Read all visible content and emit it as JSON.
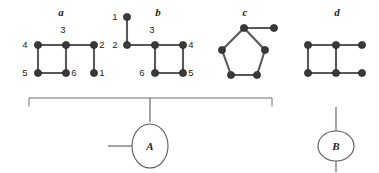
{
  "diagram": {
    "background_color": "#ffffff",
    "edge_color": "#58585b",
    "node_color": "#3a3a3c",
    "label_color": "#231f20",
    "bracket_color": "#6d6e71"
  },
  "graphs": [
    {
      "id": "graph-a",
      "label": "a",
      "label_pos": {
        "x": 61,
        "y": 16
      },
      "vertices": [
        {
          "name": "v4",
          "label": "4",
          "x": 38,
          "y": 45,
          "label_pos": {
            "x": 25,
            "y": 48
          }
        },
        {
          "name": "v3",
          "label": "3",
          "x": 66,
          "y": 45,
          "label_pos": {
            "x": 63,
            "y": 33
          }
        },
        {
          "name": "v2",
          "label": "2",
          "x": 94,
          "y": 45,
          "label_pos": {
            "x": 102,
            "y": 48
          }
        },
        {
          "name": "v5",
          "label": "5",
          "x": 38,
          "y": 73,
          "label_pos": {
            "x": 25,
            "y": 76
          }
        },
        {
          "name": "v6",
          "label": "6",
          "x": 66,
          "y": 73,
          "label_pos": {
            "x": 74,
            "y": 76
          }
        },
        {
          "name": "v1",
          "label": "1",
          "x": 94,
          "y": 73,
          "label_pos": {
            "x": 102,
            "y": 76
          }
        }
      ],
      "edges": [
        {
          "from": "v4",
          "to": "v3"
        },
        {
          "from": "v3",
          "to": "v2"
        },
        {
          "from": "v4",
          "to": "v5"
        },
        {
          "from": "v3",
          "to": "v6"
        },
        {
          "from": "v5",
          "to": "v6"
        },
        {
          "from": "v2",
          "to": "v1"
        }
      ]
    },
    {
      "id": "graph-b",
      "label": "b",
      "label_pos": {
        "x": 158,
        "y": 16
      },
      "vertices": [
        {
          "name": "v1",
          "label": "1",
          "x": 127,
          "y": 17,
          "label_pos": {
            "x": 115,
            "y": 20
          }
        },
        {
          "name": "v2",
          "label": "2",
          "x": 127,
          "y": 45,
          "label_pos": {
            "x": 115,
            "y": 48
          }
        },
        {
          "name": "v3",
          "label": "3",
          "x": 155,
          "y": 45,
          "label_pos": {
            "x": 152,
            "y": 33
          }
        },
        {
          "name": "v4",
          "label": "4",
          "x": 183,
          "y": 45,
          "label_pos": {
            "x": 191,
            "y": 48
          }
        },
        {
          "name": "v6",
          "label": "6",
          "x": 155,
          "y": 73,
          "label_pos": {
            "x": 142,
            "y": 76
          }
        },
        {
          "name": "v5",
          "label": "5",
          "x": 183,
          "y": 73,
          "label_pos": {
            "x": 191,
            "y": 76
          }
        }
      ],
      "edges": [
        {
          "from": "v1",
          "to": "v2"
        },
        {
          "from": "v2",
          "to": "v3"
        },
        {
          "from": "v3",
          "to": "v4"
        },
        {
          "from": "v3",
          "to": "v6"
        },
        {
          "from": "v4",
          "to": "v5"
        },
        {
          "from": "v6",
          "to": "v5"
        }
      ]
    },
    {
      "id": "graph-c",
      "label": "c",
      "label_pos": {
        "x": 245,
        "y": 16
      },
      "vertices": [
        {
          "name": "p1",
          "label": "",
          "x": 244,
          "y": 28,
          "label_pos": null
        },
        {
          "name": "p2",
          "label": "",
          "x": 274,
          "y": 28,
          "label_pos": null
        },
        {
          "name": "p3",
          "label": "",
          "x": 222,
          "y": 50,
          "label_pos": null
        },
        {
          "name": "p4",
          "label": "",
          "x": 265,
          "y": 50,
          "label_pos": null
        },
        {
          "name": "p5",
          "label": "",
          "x": 231,
          "y": 75,
          "label_pos": null
        },
        {
          "name": "p6",
          "label": "",
          "x": 257,
          "y": 75,
          "label_pos": null
        }
      ],
      "edges": [
        {
          "from": "p1",
          "to": "p2"
        },
        {
          "from": "p1",
          "to": "p3"
        },
        {
          "from": "p1",
          "to": "p4"
        },
        {
          "from": "p3",
          "to": "p5"
        },
        {
          "from": "p4",
          "to": "p6"
        },
        {
          "from": "p5",
          "to": "p6"
        }
      ]
    },
    {
      "id": "graph-d",
      "label": "d",
      "label_pos": {
        "x": 337,
        "y": 16
      },
      "vertices": [
        {
          "name": "q1",
          "label": "",
          "x": 308,
          "y": 45,
          "label_pos": null
        },
        {
          "name": "q2",
          "label": "",
          "x": 336,
          "y": 45,
          "label_pos": null
        },
        {
          "name": "q3",
          "label": "",
          "x": 362,
          "y": 45,
          "label_pos": null
        },
        {
          "name": "q4",
          "label": "",
          "x": 308,
          "y": 73,
          "label_pos": null
        },
        {
          "name": "q5",
          "label": "",
          "x": 336,
          "y": 73,
          "label_pos": null
        },
        {
          "name": "q6",
          "label": "",
          "x": 362,
          "y": 73,
          "label_pos": null
        }
      ],
      "edges": [
        {
          "from": "q1",
          "to": "q2"
        },
        {
          "from": "q2",
          "to": "q3"
        },
        {
          "from": "q1",
          "to": "q4"
        },
        {
          "from": "q2",
          "to": "q5"
        },
        {
          "from": "q4",
          "to": "q5"
        },
        {
          "from": "q5",
          "to": "q6"
        }
      ]
    }
  ],
  "grouping": {
    "bracket": {
      "name": "bracket-a-to-c",
      "left_x": 29,
      "right_x": 272,
      "top_y": 98,
      "tick_height": 8,
      "stem_x": 150,
      "stem_bottom_y": 122
    },
    "node_a": {
      "label": "A",
      "cx": 150,
      "cy": 146,
      "rx": 18,
      "ry": 22,
      "lead_line": {
        "x1": 108,
        "y1": 146,
        "x2": 132,
        "y2": 146
      }
    },
    "node_b": {
      "label": "B",
      "cx": 336,
      "cy": 146,
      "rx": 18,
      "ry": 15,
      "lead_top": {
        "x1": 336,
        "y1": 107,
        "x2": 336,
        "y2": 131
      },
      "lead_bottom": {
        "x1": 336,
        "y1": 161,
        "x2": 336,
        "y2": 172
      }
    }
  }
}
